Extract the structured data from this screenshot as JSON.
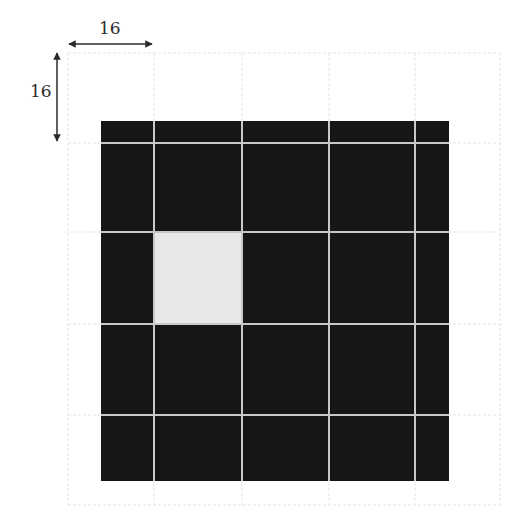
{
  "diagram": {
    "dimension_labels": {
      "horizontal": "16",
      "vertical": "16"
    },
    "colors": {
      "background": "#ffffff",
      "block_fill": "#161616",
      "highlight_fill": "#e8e8e8",
      "inner_grid": "#c8c8c8",
      "outer_grid": "#e4e4e4",
      "arrow": "#2a2a2a"
    },
    "outer_grid": {
      "x_lines": [
        68,
        154,
        242,
        329,
        415,
        500
      ],
      "y_lines": [
        53,
        143,
        232,
        324,
        415,
        505
      ]
    },
    "block": {
      "x": 101,
      "y": 121,
      "width": 348,
      "height": 360
    },
    "highlighted_cell": {
      "col": 1,
      "row": 2,
      "x": 154,
      "y": 232,
      "width": 88,
      "height": 92
    }
  }
}
